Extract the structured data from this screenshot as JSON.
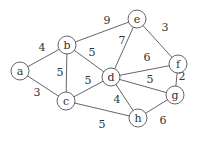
{
  "graph": {
    "nodes": [
      {
        "id": "a",
        "x": 20,
        "y": 71
      },
      {
        "id": "b",
        "x": 67,
        "y": 45
      },
      {
        "id": "c",
        "x": 66,
        "y": 101
      },
      {
        "id": "d",
        "x": 111,
        "y": 77
      },
      {
        "id": "e",
        "x": 137,
        "y": 19
      },
      {
        "id": "f",
        "x": 178,
        "y": 64
      },
      {
        "id": "g",
        "x": 175,
        "y": 95
      },
      {
        "id": "h",
        "x": 138,
        "y": 118
      }
    ],
    "edges": [
      {
        "from": "a",
        "to": "b",
        "weight": "4",
        "lx": 42,
        "ly": 51
      },
      {
        "from": "a",
        "to": "c",
        "weight": "3",
        "lx": 37,
        "ly": 96
      },
      {
        "from": "b",
        "to": "c",
        "weight": "5",
        "lx": 60,
        "ly": 76
      },
      {
        "from": "b",
        "to": "d",
        "weight": "5",
        "lx": 92,
        "ly": 56
      },
      {
        "from": "b",
        "to": "e",
        "weight": "9",
        "lx": 107,
        "ly": 24
      },
      {
        "from": "c",
        "to": "d",
        "weight": "5",
        "lx": 88,
        "ly": 84
      },
      {
        "from": "c",
        "to": "h",
        "weight": "5",
        "lx": 102,
        "ly": 128
      },
      {
        "from": "d",
        "to": "e",
        "weight": "7",
        "lx": 122,
        "ly": 44
      },
      {
        "from": "d",
        "to": "f",
        "weight": "6",
        "lx": 147,
        "ly": 61
      },
      {
        "from": "d",
        "to": "g",
        "weight": "5",
        "lx": 150,
        "ly": 83
      },
      {
        "from": "d",
        "to": "h",
        "weight": "4",
        "lx": 117,
        "ly": 103
      },
      {
        "from": "e",
        "to": "f",
        "weight": "3",
        "lx": 165,
        "ly": 31
      },
      {
        "from": "f",
        "to": "g",
        "weight": "2",
        "lx": 182,
        "ly": 80
      },
      {
        "from": "g",
        "to": "h",
        "weight": "6",
        "lx": 163,
        "ly": 124
      }
    ]
  }
}
